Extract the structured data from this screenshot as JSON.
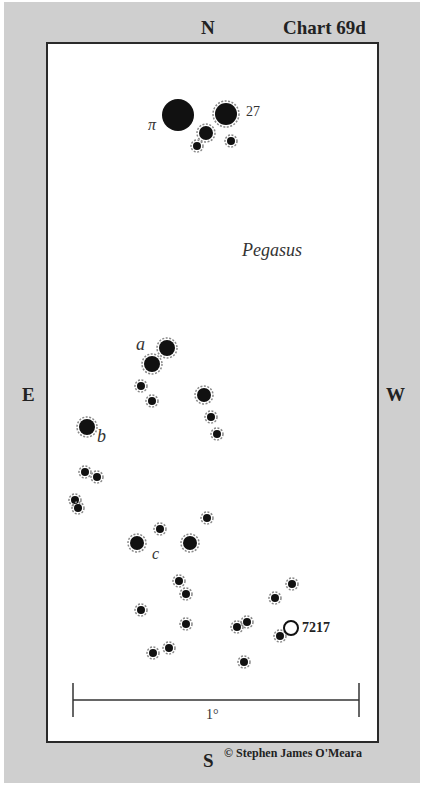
{
  "chart": {
    "title": "Chart 69d",
    "constellation": "Pegasus",
    "credit": "© Stephen James O'Meara",
    "directions": {
      "north": "N",
      "south": "S",
      "east": "E",
      "west": "W"
    },
    "scale_label": "1°",
    "object_label": "7217",
    "star_labels": {
      "pi": "π",
      "s27": "27",
      "a": "a",
      "b": "b",
      "c": "c"
    }
  },
  "colors": {
    "background": "#cfcfcf",
    "frame": "#ffffff",
    "ink": "#222222"
  },
  "stars": [
    {
      "x": 178,
      "y": 115,
      "r": 16,
      "label": "π"
    },
    {
      "x": 226,
      "y": 114,
      "r": 11,
      "label": "27"
    },
    {
      "x": 206,
      "y": 133,
      "r": 7
    },
    {
      "x": 197,
      "y": 146,
      "r": 4
    },
    {
      "x": 231,
      "y": 141,
      "r": 4
    },
    {
      "x": 167,
      "y": 348,
      "r": 8
    },
    {
      "x": 152,
      "y": 364,
      "r": 8,
      "label": "a"
    },
    {
      "x": 141,
      "y": 386,
      "r": 4
    },
    {
      "x": 152,
      "y": 401,
      "r": 4
    },
    {
      "x": 204,
      "y": 395,
      "r": 7
    },
    {
      "x": 211,
      "y": 417,
      "r": 4
    },
    {
      "x": 217,
      "y": 434,
      "r": 4
    },
    {
      "x": 87,
      "y": 427,
      "r": 8,
      "label": "b"
    },
    {
      "x": 85,
      "y": 472,
      "r": 4
    },
    {
      "x": 97,
      "y": 477,
      "r": 4
    },
    {
      "x": 75,
      "y": 500,
      "r": 4
    },
    {
      "x": 78,
      "y": 508,
      "r": 4
    },
    {
      "x": 160,
      "y": 529,
      "r": 4
    },
    {
      "x": 207,
      "y": 518,
      "r": 4
    },
    {
      "x": 137,
      "y": 543,
      "r": 7,
      "label": "c"
    },
    {
      "x": 190,
      "y": 543,
      "r": 7
    },
    {
      "x": 179,
      "y": 581,
      "r": 4
    },
    {
      "x": 186,
      "y": 594,
      "r": 4
    },
    {
      "x": 141,
      "y": 610,
      "r": 4
    },
    {
      "x": 186,
      "y": 624,
      "r": 4
    },
    {
      "x": 169,
      "y": 648,
      "r": 4
    },
    {
      "x": 153,
      "y": 653,
      "r": 4
    },
    {
      "x": 292,
      "y": 584,
      "r": 4
    },
    {
      "x": 275,
      "y": 598,
      "r": 4
    },
    {
      "x": 237,
      "y": 627,
      "r": 4
    },
    {
      "x": 247,
      "y": 622,
      "r": 4
    },
    {
      "x": 280,
      "y": 636,
      "r": 4
    },
    {
      "x": 244,
      "y": 662,
      "r": 4
    }
  ],
  "deep_sky": [
    {
      "x": 291,
      "y": 628,
      "r": 7,
      "label": "7217"
    }
  ]
}
